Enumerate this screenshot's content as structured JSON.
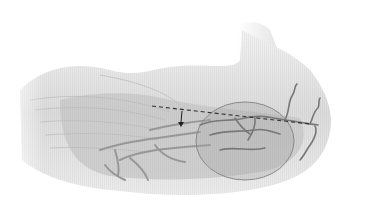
{
  "figure": {
    "elements": {
      "incision": "dashed-line",
      "highlight": "circle",
      "marker": "vertical-arrow"
    }
  },
  "colors": {
    "background": "#ffffff",
    "skin_light": "#e6e6e6",
    "skin_mid": "#cfcfcf",
    "muscle_dark": "#b3b3b3",
    "vessel": "#8a8a8a",
    "vessel_dark": "#6e6e6e",
    "dashed_line": "#333333",
    "circle_fill": "#a8a8a8",
    "circle_stroke": "#8c8c8c"
  }
}
